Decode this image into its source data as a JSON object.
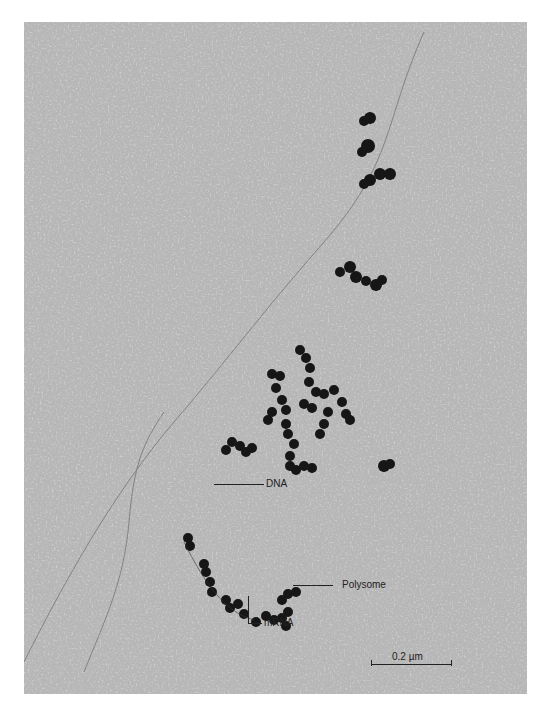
{
  "figure": {
    "type": "electron micrograph",
    "background_color": "#b8b8b8",
    "particle_color": "#141414",
    "labels": {
      "dna": "DNA",
      "polysome": "Polysome",
      "mrna": "mRNA"
    },
    "scale_bar": {
      "label": "0.2 µm",
      "length_px": 80
    }
  }
}
